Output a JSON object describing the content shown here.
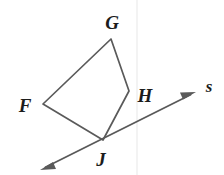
{
  "figure": {
    "background_color": "#ffffff",
    "stroke_color": "#5a5a5a",
    "label_color": "#1c1c1c",
    "width": 224,
    "height": 175
  },
  "labels": {
    "f": "F",
    "g": "G",
    "h": "H",
    "j": "J",
    "s": "s"
  },
  "label_positions": {
    "f": {
      "x": 25,
      "y": 105
    },
    "g": {
      "x": 112,
      "y": 22
    },
    "h": {
      "x": 145,
      "y": 95
    },
    "j": {
      "x": 101,
      "y": 159
    },
    "s": {
      "x": 209,
      "y": 86
    }
  },
  "chart_data": {
    "type": "diagram",
    "shapes": [
      {
        "name": "quadrilateral-FGHJ",
        "kind": "polygon",
        "closed": true,
        "vertices": [
          {
            "label": "F",
            "x": 43,
            "y": 104
          },
          {
            "label": "G",
            "x": 111,
            "y": 39
          },
          {
            "label": "H",
            "x": 129,
            "y": 91
          },
          {
            "label": "J",
            "x": 103,
            "y": 140
          }
        ]
      },
      {
        "name": "line-s",
        "kind": "double-arrow-line",
        "from": {
          "x": 40,
          "y": 170
        },
        "to": {
          "x": 196,
          "y": 92
        },
        "passes_through": "J",
        "label": "s"
      }
    ],
    "edges": [
      {
        "name": "FG",
        "from": "F",
        "to": "G"
      },
      {
        "name": "GH",
        "from": "G",
        "to": "H"
      },
      {
        "name": "HJ",
        "from": "H",
        "to": "J"
      },
      {
        "name": "JF",
        "from": "J",
        "to": "F"
      }
    ]
  }
}
